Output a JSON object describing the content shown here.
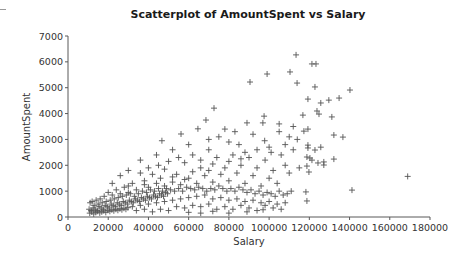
{
  "chart_data": {
    "type": "scatter",
    "title": "Scatterplot of AmountSpent vs Salary",
    "xlabel": "Salary",
    "ylabel": "AmountSpent",
    "xlim": [
      0,
      180000
    ],
    "ylim": [
      0,
      7000
    ],
    "x_ticks": [
      0,
      20000,
      40000,
      60000,
      80000,
      100000,
      120000,
      140000,
      160000,
      180000
    ],
    "y_ticks": [
      0,
      1000,
      2000,
      3000,
      4000,
      5000,
      6000,
      7000
    ],
    "x_tick_labels": [
      "0",
      "20000",
      "40000",
      "60000",
      "80000",
      "100000",
      "120000",
      "140000",
      "160000",
      "180000"
    ],
    "y_tick_labels": [
      "0",
      "1000",
      "2000",
      "3000",
      "4000",
      "5000",
      "6000",
      "7000"
    ],
    "grid": false,
    "legend": null,
    "marker": "+",
    "series": [
      {
        "name": "AmountSpent",
        "points": [
          [
            113400,
            6270
          ],
          [
            121300,
            5920
          ],
          [
            123300,
            5920
          ],
          [
            99000,
            5530
          ],
          [
            110400,
            5610
          ],
          [
            90500,
            5220
          ],
          [
            113900,
            5180
          ],
          [
            122800,
            5030
          ],
          [
            140200,
            4910
          ],
          [
            134800,
            4600
          ],
          [
            119300,
            4560
          ],
          [
            125700,
            4410
          ],
          [
            129700,
            4520
          ],
          [
            123800,
            4100
          ],
          [
            124800,
            3980
          ],
          [
            131200,
            3870
          ],
          [
            116800,
            3940
          ],
          [
            117300,
            3320
          ],
          [
            119300,
            3400
          ],
          [
            132200,
            3170
          ],
          [
            136700,
            3090
          ],
          [
            119300,
            2780
          ],
          [
            119300,
            2670
          ],
          [
            122800,
            2590
          ],
          [
            125700,
            2700
          ],
          [
            118800,
            2320
          ],
          [
            120300,
            2280
          ],
          [
            132200,
            2240
          ],
          [
            121300,
            2200
          ],
          [
            124300,
            2090
          ],
          [
            127200,
            2130
          ],
          [
            127200,
            2010
          ],
          [
            118800,
            1970
          ],
          [
            119800,
            1740
          ],
          [
            168900,
            1570
          ],
          [
            141200,
            1040
          ],
          [
            118300,
            970
          ],
          [
            118800,
            620
          ],
          [
            72600,
            4210
          ],
          [
            68600,
            3750
          ],
          [
            64600,
            3410
          ],
          [
            97500,
            3900
          ],
          [
            89000,
            3640
          ],
          [
            96900,
            3640
          ],
          [
            56200,
            3210
          ],
          [
            46700,
            2950
          ],
          [
            97800,
            2950
          ],
          [
            75000,
            3100
          ],
          [
            80000,
            2900
          ],
          [
            85000,
            2800
          ],
          [
            92000,
            3200
          ],
          [
            105000,
            3300
          ],
          [
            110000,
            3100
          ],
          [
            100000,
            2700
          ],
          [
            88000,
            2500
          ],
          [
            70000,
            2600
          ],
          [
            62000,
            2400
          ],
          [
            55000,
            2300
          ],
          [
            50000,
            2150
          ],
          [
            45000,
            2000
          ],
          [
            40000,
            1900
          ],
          [
            58000,
            2100
          ],
          [
            66000,
            2200
          ],
          [
            74000,
            2300
          ],
          [
            82000,
            2400
          ],
          [
            90000,
            2300
          ],
          [
            98000,
            2200
          ],
          [
            106000,
            2400
          ],
          [
            112000,
            2600
          ],
          [
            108000,
            2000
          ],
          [
            102000,
            1800
          ],
          [
            94000,
            1900
          ],
          [
            86000,
            2000
          ],
          [
            78000,
            1900
          ],
          [
            70000,
            1800
          ],
          [
            62000,
            1750
          ],
          [
            54000,
            1650
          ],
          [
            46000,
            1500
          ],
          [
            38000,
            1400
          ],
          [
            32000,
            1300
          ],
          [
            28000,
            1150
          ],
          [
            24000,
            1050
          ],
          [
            20000,
            950
          ],
          [
            36000,
            1700
          ],
          [
            42000,
            1650
          ],
          [
            48000,
            1850
          ],
          [
            52000,
            1550
          ],
          [
            60000,
            1500
          ],
          [
            68000,
            1600
          ],
          [
            76000,
            1650
          ],
          [
            84000,
            1700
          ],
          [
            92000,
            1600
          ],
          [
            100000,
            1500
          ],
          [
            110000,
            1700
          ],
          [
            115000,
            1900
          ],
          [
            104000,
            1300
          ],
          [
            96000,
            1200
          ],
          [
            88000,
            1300
          ],
          [
            80000,
            1400
          ],
          [
            72000,
            1350
          ],
          [
            64000,
            1300
          ],
          [
            56000,
            1250
          ],
          [
            48000,
            1200
          ],
          [
            40000,
            1150
          ],
          [
            34000,
            1050
          ],
          [
            30000,
            950
          ],
          [
            26000,
            900
          ],
          [
            22000,
            850
          ],
          [
            18000,
            800
          ],
          [
            16000,
            700
          ],
          [
            14000,
            650
          ],
          [
            12000,
            600
          ],
          [
            11000,
            550
          ],
          [
            13000,
            450
          ],
          [
            15000,
            500
          ],
          [
            17000,
            550
          ],
          [
            19000,
            600
          ],
          [
            21000,
            650
          ],
          [
            23000,
            700
          ],
          [
            25000,
            750
          ],
          [
            27000,
            800
          ],
          [
            29000,
            850
          ],
          [
            31000,
            900
          ],
          [
            33000,
            800
          ],
          [
            35000,
            900
          ],
          [
            37000,
            1000
          ],
          [
            39000,
            950
          ],
          [
            41000,
            1050
          ],
          [
            43000,
            1000
          ],
          [
            45000,
            1100
          ],
          [
            47000,
            1000
          ],
          [
            49000,
            1100
          ],
          [
            51000,
            1050
          ],
          [
            53000,
            1000
          ],
          [
            55000,
            1100
          ],
          [
            57000,
            1000
          ],
          [
            59000,
            1150
          ],
          [
            61000,
            1100
          ],
          [
            63000,
            1050
          ],
          [
            65000,
            1150
          ],
          [
            67000,
            1100
          ],
          [
            69000,
            1000
          ],
          [
            71000,
            1100
          ],
          [
            73000,
            1050
          ],
          [
            75000,
            1200
          ],
          [
            77000,
            1100
          ],
          [
            79000,
            1000
          ],
          [
            81000,
            1100
          ],
          [
            83000,
            1000
          ],
          [
            85000,
            1150
          ],
          [
            87000,
            1050
          ],
          [
            89000,
            950
          ],
          [
            91000,
            1050
          ],
          [
            93000,
            900
          ],
          [
            95000,
            1000
          ],
          [
            97000,
            850
          ],
          [
            99000,
            950
          ],
          [
            101000,
            900
          ],
          [
            103000,
            800
          ],
          [
            105000,
            1000
          ],
          [
            107000,
            850
          ],
          [
            109000,
            900
          ],
          [
            111000,
            1000
          ],
          [
            10500,
            300
          ],
          [
            11500,
            250
          ],
          [
            12500,
            350
          ],
          [
            13500,
            300
          ],
          [
            14500,
            250
          ],
          [
            15500,
            400
          ],
          [
            16500,
            350
          ],
          [
            17500,
            300
          ],
          [
            18500,
            450
          ],
          [
            19500,
            400
          ],
          [
            20500,
            350
          ],
          [
            21500,
            500
          ],
          [
            22500,
            450
          ],
          [
            23500,
            400
          ],
          [
            24500,
            550
          ],
          [
            25500,
            500
          ],
          [
            26500,
            450
          ],
          [
            27500,
            600
          ],
          [
            28500,
            550
          ],
          [
            29500,
            500
          ],
          [
            30500,
            650
          ],
          [
            31500,
            600
          ],
          [
            32500,
            550
          ],
          [
            33500,
            700
          ],
          [
            34500,
            650
          ],
          [
            35500,
            600
          ],
          [
            36500,
            750
          ],
          [
            37500,
            700
          ],
          [
            38500,
            650
          ],
          [
            39500,
            800
          ],
          [
            40500,
            750
          ],
          [
            41500,
            700
          ],
          [
            42500,
            850
          ],
          [
            43500,
            800
          ],
          [
            44500,
            750
          ],
          [
            45500,
            900
          ],
          [
            46500,
            850
          ],
          [
            47500,
            800
          ],
          [
            48500,
            950
          ],
          [
            49500,
            900
          ],
          [
            10800,
            150
          ],
          [
            11800,
            200
          ],
          [
            12800,
            120
          ],
          [
            13800,
            180
          ],
          [
            14800,
            220
          ],
          [
            15800,
            160
          ],
          [
            16800,
            200
          ],
          [
            17800,
            240
          ],
          [
            18800,
            180
          ],
          [
            19800,
            260
          ],
          [
            20800,
            220
          ],
          [
            21800,
            280
          ],
          [
            22800,
            240
          ],
          [
            23800,
            300
          ],
          [
            24800,
            260
          ],
          [
            25800,
            320
          ],
          [
            26800,
            280
          ],
          [
            27800,
            340
          ],
          [
            28800,
            300
          ],
          [
            29800,
            360
          ],
          [
            32000,
            400
          ],
          [
            36000,
            450
          ],
          [
            40000,
            500
          ],
          [
            44000,
            550
          ],
          [
            48000,
            600
          ],
          [
            52000,
            650
          ],
          [
            56000,
            700
          ],
          [
            60000,
            750
          ],
          [
            64000,
            800
          ],
          [
            68000,
            850
          ],
          [
            72000,
            700
          ],
          [
            76000,
            750
          ],
          [
            80000,
            650
          ],
          [
            84000,
            700
          ],
          [
            88000,
            600
          ],
          [
            92000,
            650
          ],
          [
            96000,
            550
          ],
          [
            100000,
            600
          ],
          [
            104000,
            500
          ],
          [
            108000,
            550
          ],
          [
            34000,
            250
          ],
          [
            38000,
            300
          ],
          [
            42000,
            200
          ],
          [
            46000,
            300
          ],
          [
            50000,
            250
          ],
          [
            54000,
            400
          ],
          [
            58000,
            350
          ],
          [
            62000,
            450
          ],
          [
            66000,
            400
          ],
          [
            70000,
            500
          ],
          [
            74000,
            300
          ],
          [
            78000,
            400
          ],
          [
            82000,
            300
          ],
          [
            86000,
            450
          ],
          [
            90000,
            350
          ],
          [
            94000,
            250
          ],
          [
            98000,
            450
          ],
          [
            102000,
            350
          ],
          [
            80000,
            150
          ],
          [
            89000,
            200
          ],
          [
            97000,
            280
          ],
          [
            106000,
            300
          ],
          [
            60000,
            180
          ],
          [
            66000,
            150
          ],
          [
            72000,
            220
          ],
          [
            52000,
            1350
          ],
          [
            58000,
            1450
          ],
          [
            44000,
            1300
          ],
          [
            38000,
            1250
          ],
          [
            30000,
            1200
          ],
          [
            66000,
            1900
          ],
          [
            72000,
            2050
          ],
          [
            80000,
            2150
          ],
          [
            86000,
            2250
          ],
          [
            94000,
            2600
          ],
          [
            101000,
            2500
          ],
          [
            108000,
            2800
          ],
          [
            114000,
            3000
          ],
          [
            112000,
            3500
          ],
          [
            105000,
            3600
          ],
          [
            83000,
            3300
          ],
          [
            78000,
            3400
          ],
          [
            70000,
            3000
          ],
          [
            60000,
            2800
          ],
          [
            52000,
            2600
          ],
          [
            44000,
            2400
          ],
          [
            36000,
            2200
          ],
          [
            26000,
            1600
          ],
          [
            22000,
            1300
          ],
          [
            30000,
            1800
          ]
        ]
      }
    ]
  }
}
